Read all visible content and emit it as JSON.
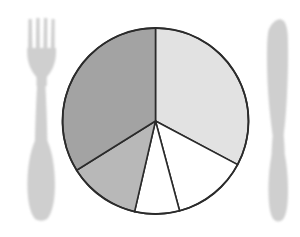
{
  "image": {
    "title": "Pie chart served on a plate between a fork and a knife",
    "background_color": "#ffffff",
    "width": 300,
    "height": 237
  },
  "chart_data": {
    "type": "pie",
    "title": "",
    "subtitle": "",
    "xlabel": "",
    "ylabel": "",
    "legend_position": "none",
    "grid": false,
    "labels_shown": false,
    "center": {
      "x": 155.5,
      "y": 121
    },
    "radius": 93,
    "start_angle_deg": 0,
    "direction": "clockwise",
    "stroke_color": "#2b2b2b",
    "stroke_width": 1.6,
    "categories": [
      "Slice A",
      "Slice B",
      "Slice C",
      "Slice D",
      "Slice E"
    ],
    "values": [
      32.8,
      13.1,
      7.8,
      12.5,
      33.9
    ],
    "angles_deg": [
      118,
      47,
      28,
      45,
      122
    ],
    "start_angles_deg": [
      0,
      118,
      165,
      193,
      238
    ],
    "end_angles_deg": [
      118,
      165,
      193,
      238,
      360
    ],
    "colors": [
      "#e2e2e2",
      "#ffffff",
      "#ffffff",
      "#b8b8b8",
      "#a3a3a3"
    ],
    "series": [
      {
        "name": "Plate portions",
        "values": [
          32.8,
          13.1,
          7.8,
          12.5,
          33.9
        ]
      }
    ]
  },
  "cutlery": {
    "fork": {
      "name": "fork",
      "color": "#cfcfcf",
      "tine_count": 4,
      "side": "left"
    },
    "knife": {
      "name": "knife",
      "color": "#cfcfcf",
      "side": "right"
    }
  }
}
